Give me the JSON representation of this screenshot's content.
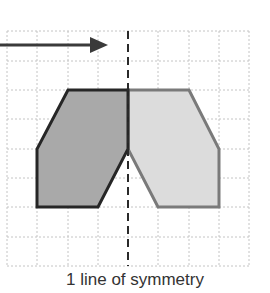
{
  "diagram": {
    "caption": "1 line of symmetry",
    "grid": {
      "columns": 8,
      "rows": 8,
      "line_style": "dotted",
      "line_color": "#c4c4c4"
    },
    "symmetry_line": {
      "orientation": "vertical",
      "style": "dashed",
      "color": "#2a2a2a"
    },
    "arrow": {
      "direction": "right",
      "color": "#3a3a3a"
    },
    "shape": {
      "left_half": {
        "fill": "#a9a9a9",
        "stroke": "#262626",
        "label": "original half"
      },
      "right_half": {
        "fill": "#dcdcdc",
        "stroke": "#7a7a7a",
        "label": "reflected half"
      }
    },
    "colors": {
      "dark_fill": "#a9a9a9",
      "light_fill": "#dcdcdc",
      "dark_outline": "#262626",
      "light_outline": "#7a7a7a"
    }
  }
}
